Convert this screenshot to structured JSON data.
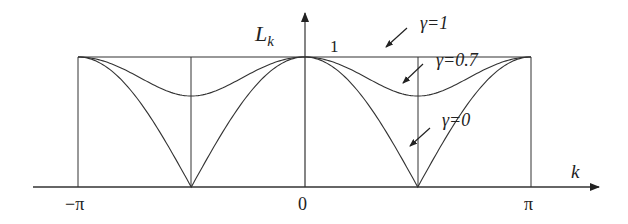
{
  "diagram": {
    "title": "",
    "y_axis_label": "L",
    "y_axis_subscript": "k",
    "x_axis_label": "k",
    "y_tick_one": "1",
    "x_ticks": [
      "−π",
      "0",
      "π"
    ],
    "curves": [
      {
        "label": "γ=1",
        "gamma": 1.0
      },
      {
        "label": "γ=0.7",
        "gamma": 0.7
      },
      {
        "label": "γ=0",
        "gamma": 0.0
      }
    ],
    "line_color": "#333333"
  },
  "chart_data": {
    "type": "line",
    "title": "",
    "xlabel": "k",
    "ylabel": "L_k",
    "xlim": [
      -3.1416,
      3.1416
    ],
    "ylim": [
      0,
      1
    ],
    "x_tick_labels": [
      "-π",
      "0",
      "π"
    ],
    "y_tick_labels": [
      "1"
    ],
    "series": [
      {
        "name": "γ=1",
        "formula": "1",
        "values_at": {
          "-π": 1,
          "-π/2": 1,
          "0": 1,
          "π/2": 1,
          "π": 1
        }
      },
      {
        "name": "γ=0.7",
        "formula": "sqrt(cos²k + 0.49 sin²k)",
        "values_at": {
          "-π": 1,
          "-π/2": 0.7,
          "0": 1,
          "π/2": 0.7,
          "π": 1
        }
      },
      {
        "name": "γ=0",
        "formula": "|cos k|",
        "values_at": {
          "-π": 1,
          "-π/2": 0,
          "0": 1,
          "π/2": 0,
          "π": 1
        }
      }
    ],
    "grid": false,
    "annotations": [
      "γ=1",
      "γ=0.7",
      "γ=0",
      "1"
    ]
  }
}
